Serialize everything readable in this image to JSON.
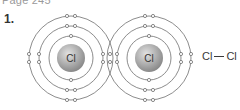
{
  "header": {
    "text": "Page 245"
  },
  "question": {
    "number": "1."
  },
  "molecule": {
    "name": "chlorine",
    "atoms": [
      {
        "symbol": "Cl",
        "center": [
          71,
          58
        ]
      },
      {
        "symbol": "Cl",
        "center": [
          149,
          58
        ]
      }
    ],
    "shell_radii": [
      22,
      32,
      42
    ],
    "nucleus_radius": 14
  },
  "formula": {
    "left": "Cl",
    "right": "Cl"
  },
  "colors": {
    "line": "#6e6e6e",
    "nucleus_light": "#d8d8d8",
    "nucleus_dark": "#8a8a8a",
    "text": "#333333"
  }
}
